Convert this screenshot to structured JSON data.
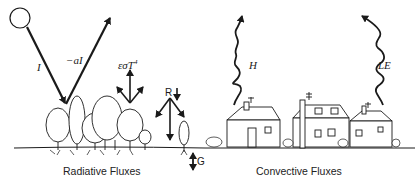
{
  "diagram": {
    "left_panel": {
      "caption": "Radiative Fluxes",
      "labels": {
        "incoming": "I",
        "reflected": "−aI",
        "emitted": "εσT",
        "emitted_exp": "4",
        "net_radiation": "R",
        "ground_flux": "G"
      }
    },
    "right_panel": {
      "caption": "Convective Fluxes",
      "labels": {
        "sensible_heat": "H",
        "latent_heat": "LE"
      }
    },
    "colors": {
      "ink": "#1a1a1a",
      "background": "#ffffff"
    }
  }
}
